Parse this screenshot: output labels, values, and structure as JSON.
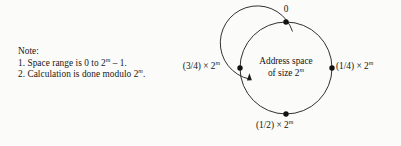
{
  "background_color": "#fbfbf9",
  "stroke_color": "#1a1a1a",
  "text_color": "#181818",
  "note": {
    "heading": "Note:",
    "lines": [
      {
        "prefix": "1. Space range is 0 to 2",
        "exponent": "m",
        "suffix": " – 1."
      },
      {
        "prefix": "2. Calculation is done modulo 2",
        "exponent": "m",
        "suffix": "."
      }
    ]
  },
  "diagram": {
    "type": "ring-address-space",
    "center_text": {
      "line1": "Address space",
      "line2_prefix": "of size 2",
      "line2_exponent": "m"
    },
    "nodes": [
      {
        "position": "top",
        "angle_deg": 90,
        "label": "0",
        "exponent": "",
        "suffix": ""
      },
      {
        "position": "right",
        "angle_deg": 0,
        "label": "(1/4) × 2",
        "exponent": "m",
        "suffix": ""
      },
      {
        "position": "bottom",
        "angle_deg": 270,
        "label": "(1/2) × 2",
        "exponent": "m",
        "suffix": ""
      },
      {
        "position": "left",
        "angle_deg": 180,
        "label": "(3/4) × 2",
        "exponent": "m",
        "suffix": ""
      }
    ],
    "arrow": {
      "name": "clockwise-direction-arrow",
      "direction": "clockwise",
      "head_position": "inner-left"
    },
    "geometry": {
      "center_x": 106,
      "center_y": 68,
      "outer_radius": 46,
      "inner_radius": 37,
      "dot_radius": 2.6
    }
  }
}
